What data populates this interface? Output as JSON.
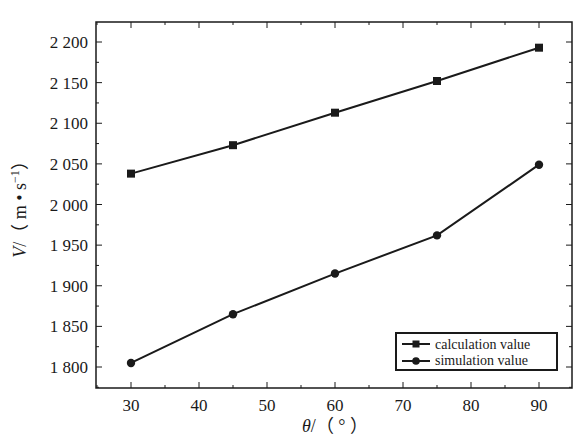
{
  "chart_data": {
    "type": "line",
    "title": "",
    "xlabel": "θ/（°）",
    "ylabel": "V/（m•s⁻¹）",
    "x": [
      30,
      45,
      60,
      75,
      90
    ],
    "xlim": [
      25,
      95
    ],
    "ylim": [
      1775,
      2225
    ],
    "xticks": [
      30,
      40,
      50,
      60,
      70,
      80,
      90
    ],
    "xtick_labels": [
      "30",
      "40",
      "50",
      "60",
      "70",
      "80",
      "90"
    ],
    "yticks": [
      1800,
      1850,
      1900,
      1950,
      2000,
      2050,
      2100,
      2150,
      2200
    ],
    "ytick_labels": [
      "1 800",
      "1 850",
      "1 900",
      "1 950",
      "2 000",
      "2 050",
      "2 100",
      "2 150",
      "2 200"
    ],
    "grid": false,
    "legend_position": "lower right",
    "series": [
      {
        "name": "calculation value",
        "marker": "square",
        "color": "#1a1a1a",
        "values": [
          2038,
          2073,
          2113,
          2152,
          2193
        ]
      },
      {
        "name": "simulation value",
        "marker": "circle",
        "color": "#1a1a1a",
        "values": [
          1805,
          1865,
          1915,
          1962,
          2049
        ]
      }
    ]
  },
  "labels": {
    "xlabel_theta": "θ",
    "xlabel_rest": "/（ ° ）",
    "ylabel_v": "V",
    "ylabel_rest": "/（ m • s",
    "ylabel_sup": "−1",
    "ylabel_close": "）"
  }
}
